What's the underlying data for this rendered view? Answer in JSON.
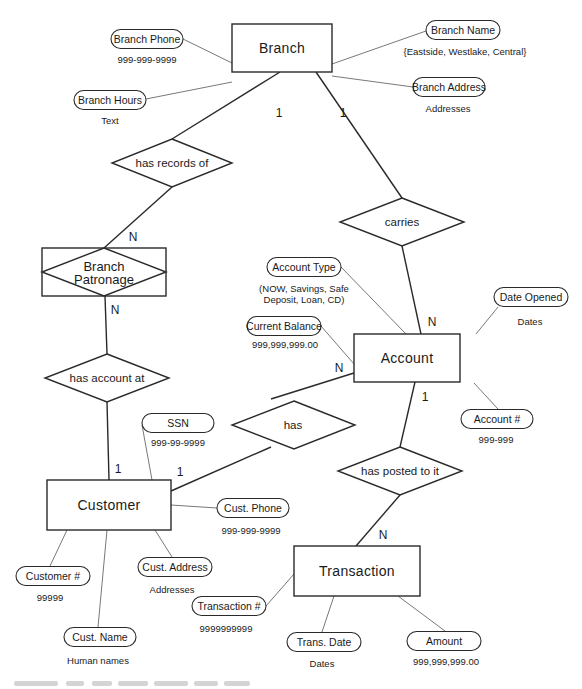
{
  "diagram": {
    "entities": [
      {
        "id": "branch",
        "label": "Branch",
        "x": 232,
        "y": 24,
        "w": 100,
        "h": 48
      },
      {
        "id": "account",
        "label": "Account",
        "x": 354,
        "y": 334,
        "w": 106,
        "h": 48
      },
      {
        "id": "customer",
        "label": "Customer",
        "x": 47,
        "y": 480,
        "w": 124,
        "h": 50
      },
      {
        "id": "transaction",
        "label": "Transaction",
        "x": 294,
        "y": 546,
        "w": 126,
        "h": 50
      }
    ],
    "weak_relationship": {
      "id": "branch-patronage",
      "label_line1": "Branch",
      "label_line2": "Patronage",
      "x": 42,
      "y": 248,
      "w": 124,
      "h": 48
    },
    "relationships": [
      {
        "id": "has-records-of",
        "label": "has records of",
        "cx": 172,
        "cy": 163,
        "hw": 60,
        "hh": 24
      },
      {
        "id": "carries",
        "label": "carries",
        "cx": 402,
        "cy": 222,
        "hw": 62,
        "hh": 24
      },
      {
        "id": "has-account-at",
        "label": "has account at",
        "cx": 107,
        "cy": 378,
        "hw": 62,
        "hh": 24
      },
      {
        "id": "has",
        "label": "has",
        "cx": 271,
        "cy": 423,
        "hw": 62,
        "hh": 24
      },
      {
        "id": "has-posted-to-it",
        "label": "has posted to it",
        "cx": 400,
        "cy": 471,
        "hw": 62,
        "hh": 24
      }
    ],
    "attributes": [
      {
        "id": "branch-phone",
        "label": "Branch Phone",
        "domain": "999-999-9999",
        "cx": 147,
        "cy": 39,
        "w": 72,
        "h": 19,
        "dx": 147,
        "dy": 59
      },
      {
        "id": "branch-hours",
        "label": "Branch Hours",
        "domain": "Text",
        "cx": 110,
        "cy": 100,
        "w": 72,
        "h": 19,
        "dx": 110,
        "dy": 120
      },
      {
        "id": "branch-name",
        "label": "Branch Name",
        "domain": "{Eastside, Westlake, Central}",
        "cx": 463,
        "cy": 30,
        "w": 74,
        "h": 19,
        "dx": 465,
        "dy": 51
      },
      {
        "id": "branch-address",
        "label": "Branch Address",
        "domain": "Addresses",
        "cx": 449,
        "cy": 87,
        "w": 72,
        "h": 19,
        "dx": 448,
        "dy": 108
      },
      {
        "id": "account-type",
        "label": "Account Type",
        "domain_line1": "(NOW, Savings, Safe",
        "domain_line2": "Deposit, Loan, CD)",
        "cx": 304,
        "cy": 267,
        "w": 74,
        "h": 19,
        "dx": 304,
        "dy": 292
      },
      {
        "id": "date-opened",
        "label": "Date Opened",
        "domain": "Dates",
        "cx": 531,
        "cy": 297,
        "w": 74,
        "h": 19,
        "dx": 530,
        "dy": 321
      },
      {
        "id": "current-balance",
        "label": "Current Balance",
        "domain": "999,999,999.00",
        "cx": 284,
        "cy": 326,
        "w": 74,
        "h": 19,
        "dx": 285,
        "dy": 344
      },
      {
        "id": "account-number",
        "label": "Account #",
        "domain": "999-999",
        "cx": 497,
        "cy": 419,
        "w": 72,
        "h": 19,
        "dx": 496,
        "dy": 439
      },
      {
        "id": "ssn",
        "label": "SSN",
        "domain": "999-99-9999",
        "cx": 178,
        "cy": 423,
        "w": 72,
        "h": 19,
        "dx": 178,
        "dy": 442
      },
      {
        "id": "cust-phone",
        "label": "Cust. Phone",
        "domain": "999-999-9999",
        "cx": 253,
        "cy": 508,
        "w": 72,
        "h": 19,
        "dx": 251,
        "dy": 530
      },
      {
        "id": "customer-number",
        "label": "Customer #",
        "domain": "99999",
        "cx": 53,
        "cy": 576,
        "w": 74,
        "h": 19,
        "dx": 50,
        "dy": 597
      },
      {
        "id": "cust-address",
        "label": "Cust. Address",
        "domain": "Addresses",
        "cx": 175,
        "cy": 567,
        "w": 74,
        "h": 19,
        "dx": 172,
        "dy": 589
      },
      {
        "id": "cust-name",
        "label": "Cust. Name",
        "domain": "Human names",
        "cx": 100,
        "cy": 637,
        "w": 72,
        "h": 19,
        "dx": 98,
        "dy": 660
      },
      {
        "id": "transaction-number",
        "label": "Transaction #",
        "domain": "9999999999",
        "cx": 229,
        "cy": 606,
        "w": 74,
        "h": 19,
        "dx": 226,
        "dy": 628
      },
      {
        "id": "trans-date",
        "label": "Trans. Date",
        "domain": "Dates",
        "cx": 324,
        "cy": 642,
        "w": 74,
        "h": 19,
        "dx": 322,
        "dy": 663
      },
      {
        "id": "amount",
        "label": "Amount",
        "domain": "999,999,999.00",
        "cx": 444,
        "cy": 641,
        "w": 74,
        "h": 19,
        "dx": 446,
        "dy": 661
      }
    ],
    "cardinalities": [
      {
        "id": "branch-records",
        "label": "1",
        "x": 279,
        "y": 113
      },
      {
        "id": "branch-carries",
        "label": "1",
        "x": 343,
        "y": 113
      },
      {
        "id": "patronage-records",
        "label": "N",
        "x": 133,
        "y": 237
      },
      {
        "id": "patronage-account-at",
        "label": "N",
        "x": 115,
        "y": 310
      },
      {
        "id": "account-carries",
        "label": "N",
        "x": 432,
        "y": 322
      },
      {
        "id": "account-has",
        "label": "N",
        "x": 339,
        "y": 368
      },
      {
        "id": "account-posted",
        "label": "1",
        "x": 425,
        "y": 397
      },
      {
        "id": "customer-account-at",
        "label": "1",
        "x": 118,
        "y": 469
      },
      {
        "id": "customer-has",
        "label": "1",
        "x": 180,
        "y": 472
      },
      {
        "id": "transaction-posted",
        "label": "N",
        "x": 383,
        "y": 535
      }
    ]
  }
}
